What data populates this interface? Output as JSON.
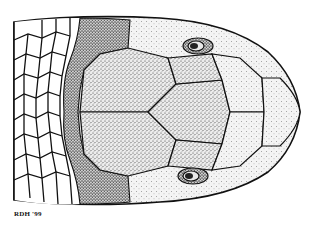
{
  "illustration": {
    "subject": "snake head, dorsal view",
    "style": "stippled pen-and-ink scientific illustration",
    "signature": "RDH '99",
    "colors": {
      "ink": "#111111",
      "paper": "#ffffff",
      "stipple_dark": "#9a9a9a",
      "stipple_light": "#d2d2d2"
    }
  }
}
